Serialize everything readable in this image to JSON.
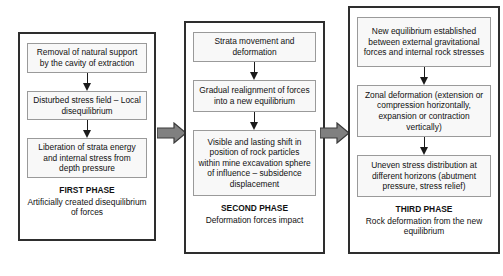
{
  "diagram": {
    "colors": {
      "container_border": "#2e2e2e",
      "step_border": "#9a9a9a",
      "step_fill": "#f8f8f8",
      "arrow_fill": "#808080",
      "arrow_outline": "#3a3a3a",
      "text": "#111111",
      "background": "#ffffff"
    },
    "phases": [
      {
        "id": "first-phase",
        "steps": [
          "Removal of natural support by the cavity of extraction",
          "Disturbed stress field – Local disequilibrium",
          "Liberation of strata energy and internal stress from depth pressure"
        ],
        "caption_title": "FIRST PHASE",
        "caption_sub": "Artificially created disequilibrium of forces"
      },
      {
        "id": "second-phase",
        "steps": [
          "Strata movement and deformation",
          "Gradual realignment of forces into a new equilibrium",
          "Visible and lasting shift in position of rock particles within mine excavation sphere of influence – subsidence displacement"
        ],
        "caption_title": "SECOND PHASE",
        "caption_sub": "Deformation forces impact"
      },
      {
        "id": "third-phase",
        "steps": [
          "New equilibrium established between external gravitational forces and internal rock stresses",
          "Zonal deformation (extension or compression horizontally, expansion or contraction vertically)",
          "Uneven stress distribution at different horizons (abutment pressure, stress relief)"
        ],
        "caption_title": "THIRD PHASE",
        "caption_sub": "Rock deformation from the new equilibrium"
      }
    ],
    "connectors": {
      "between_phase_1_2": "block-arrow-right",
      "between_phase_2_3": "block-arrow-right",
      "within_phase": "down-arrow"
    }
  }
}
